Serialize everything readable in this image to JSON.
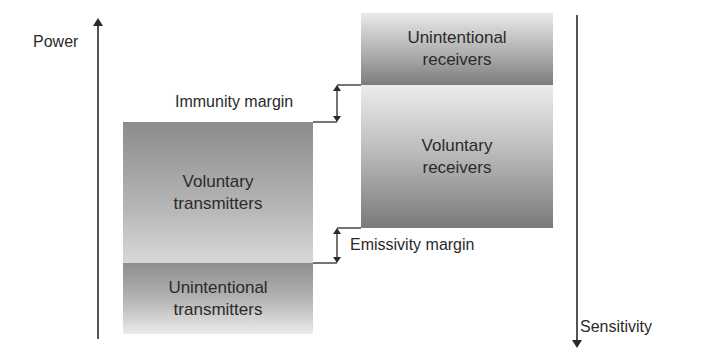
{
  "axes": {
    "power": {
      "label": "Power",
      "direction": "up"
    },
    "sensitivity": {
      "label": "Sensitivity",
      "direction": "down"
    }
  },
  "left_stack": {
    "voluntary_transmitters": "Voluntary\ntransmitters",
    "unintentional_transmitters": "Unintentional\ntransmitters"
  },
  "right_stack": {
    "unintentional_receivers": "Unintentional\nreceivers",
    "voluntary_receivers": "Voluntary\nreceivers"
  },
  "margins": {
    "immunity": "Immunity margin",
    "emissivity": "Emissivity margin"
  },
  "colors": {
    "line": "#2a2a2a",
    "background": "#ffffff"
  }
}
